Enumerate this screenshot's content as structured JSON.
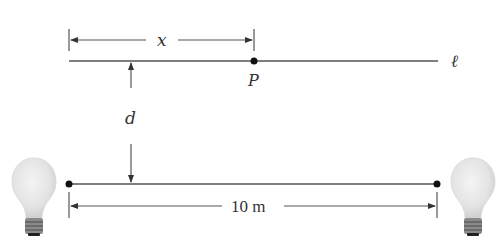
{
  "diagram": {
    "labels": {
      "x": "x",
      "P": "P",
      "line": "ℓ",
      "d": "d",
      "distance": "10 m"
    },
    "colors": {
      "line": "#555555",
      "dot": "#111111",
      "text": "#333333",
      "bulb_glass": "#e6e6e6",
      "bulb_base": "#6a6a6a"
    }
  }
}
